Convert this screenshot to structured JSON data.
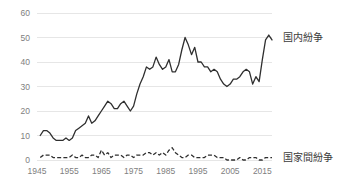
{
  "chart_data": {
    "type": "line",
    "title": "",
    "xlabel": "",
    "ylabel": "",
    "xlim": [
      1945,
      2018
    ],
    "ylim": [
      0,
      60
    ],
    "grid": true,
    "legend_position": "right",
    "y_ticks": [
      0,
      10,
      20,
      30,
      40,
      50,
      60
    ],
    "y_tick_labels": [
      "0",
      "10",
      "20",
      "30",
      "40",
      "50",
      "60"
    ],
    "x_ticks": [
      1945,
      1955,
      1965,
      1975,
      1985,
      1995,
      2005,
      2015
    ],
    "x_tick_labels": [
      "1945",
      "1955",
      "1965",
      "1975",
      "1985",
      "1995",
      "2005",
      "2015"
    ],
    "x": [
      1946,
      1947,
      1948,
      1949,
      1950,
      1951,
      1952,
      1953,
      1954,
      1955,
      1956,
      1957,
      1958,
      1959,
      1960,
      1961,
      1962,
      1963,
      1964,
      1965,
      1966,
      1967,
      1968,
      1969,
      1970,
      1971,
      1972,
      1973,
      1974,
      1975,
      1976,
      1977,
      1978,
      1979,
      1980,
      1981,
      1982,
      1983,
      1984,
      1985,
      1986,
      1987,
      1988,
      1989,
      1990,
      1991,
      1992,
      1993,
      1994,
      1995,
      1996,
      1997,
      1998,
      1999,
      2000,
      2001,
      2002,
      2003,
      2004,
      2005,
      2006,
      2007,
      2008,
      2009,
      2010,
      2011,
      2012,
      2013,
      2014,
      2015,
      2016,
      2017,
      2018
    ],
    "series": [
      {
        "name": "国内紛争",
        "style": "solid",
        "color": "#2f2f2f",
        "label_x": 2018,
        "label_y": 50,
        "values": [
          10,
          12,
          12,
          11,
          9,
          8,
          8,
          8,
          9,
          8,
          9,
          12,
          13,
          14,
          15,
          18,
          15,
          16,
          18,
          20,
          22,
          24,
          23,
          21,
          21,
          23,
          24,
          22,
          20,
          22,
          27,
          31,
          34,
          38,
          37,
          38,
          42,
          39,
          37,
          38,
          41,
          36,
          36,
          39,
          45,
          50,
          47,
          43,
          46,
          40,
          40,
          38,
          38,
          36,
          37,
          36,
          33,
          31,
          30,
          31,
          33,
          33,
          34,
          36,
          37,
          36,
          31,
          34,
          32,
          41,
          49,
          51,
          49
        ]
      },
      {
        "name": "国家間紛争",
        "style": "dashed",
        "color": "#2f2f2f",
        "label_x": 2018,
        "label_y": 1,
        "values": [
          1,
          2,
          2,
          2,
          1,
          1,
          1,
          1,
          1,
          1,
          2,
          1,
          1,
          2,
          1,
          1,
          2,
          2,
          1,
          4,
          2,
          3,
          1,
          2,
          2,
          2,
          1,
          2,
          2,
          1,
          2,
          2,
          2,
          3,
          3,
          2,
          3,
          2,
          3,
          2,
          4,
          5,
          3,
          2,
          1,
          1,
          2,
          2,
          1,
          1,
          1,
          1,
          2,
          2,
          2,
          1,
          1,
          1,
          0,
          0,
          0,
          0,
          1,
          0,
          0,
          1,
          1,
          1,
          0,
          0,
          1,
          1,
          1
        ]
      }
    ]
  }
}
